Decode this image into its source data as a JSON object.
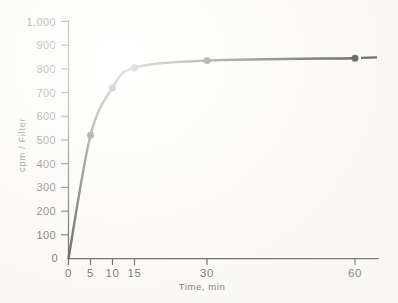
{
  "figure": {
    "background_color": "#fbfaf7",
    "ink_color": "#111111"
  },
  "chart_data": {
    "type": "line",
    "title": "",
    "subtitle": "",
    "xlabel": "Time, min",
    "ylabel": "cpm / Filter",
    "x": [
      0,
      5,
      10,
      15,
      30,
      60
    ],
    "values": [
      0,
      520,
      720,
      805,
      835,
      845
    ],
    "series": [
      {
        "name": "cpm / Filter",
        "x": [
          0,
          5,
          10,
          15,
          30,
          60
        ],
        "values": [
          0,
          520,
          720,
          805,
          835,
          845
        ]
      }
    ],
    "xticks": [
      "0",
      "5",
      "10",
      "15",
      "30",
      "60"
    ],
    "xtick_values": [
      0,
      5,
      10,
      15,
      30,
      60
    ],
    "yticks": [
      "0",
      "100",
      "200",
      "300",
      "400",
      "500",
      "600",
      "700",
      "800",
      "900",
      "1,000"
    ],
    "ytick_values": [
      0,
      100,
      200,
      300,
      400,
      500,
      600,
      700,
      800,
      900,
      1000
    ],
    "ylim": [
      0,
      1000
    ],
    "xlim": [
      0,
      65
    ],
    "x_axis_scale": "nonlinear-compressed",
    "grid": false,
    "legend": false,
    "legend_position": "none",
    "marker": "filled-circle",
    "annotations": []
  },
  "axes": {
    "y_title": "cpm / Filter",
    "x_title": "Time, min",
    "y_tick_labels": [
      "1,000",
      "900",
      "800",
      "700",
      "600",
      "500",
      "400",
      "300",
      "200",
      "100",
      "0"
    ],
    "x_tick_labels": [
      "0",
      "5",
      "10",
      "15",
      "30",
      "60"
    ]
  }
}
